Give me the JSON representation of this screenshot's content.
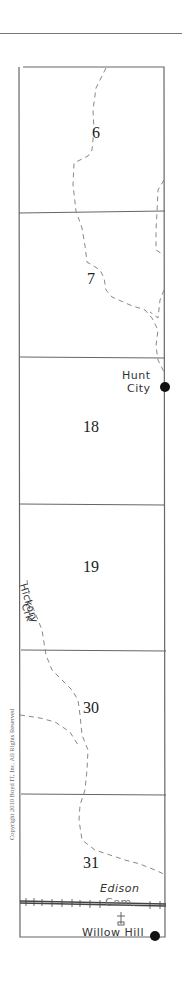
{
  "map": {
    "type": "township section strip map",
    "sections": [
      {
        "number": "6"
      },
      {
        "number": "7"
      },
      {
        "number": "18"
      },
      {
        "number": "19"
      },
      {
        "number": "30"
      },
      {
        "number": "31"
      }
    ],
    "towns": [
      {
        "name_line1": "Hunt",
        "name_line2": "City"
      },
      {
        "name": "Willow Hill"
      }
    ],
    "cemetery": {
      "name_line1": "Edison",
      "name_line2": "Cem.",
      "symbol": "cross-icon"
    },
    "creek": {
      "name_line1": "Hickory",
      "name_line2": "Crk"
    },
    "copyright": "Copyright 2010 Boyd IT, Inc. All Rights Reserved",
    "colors": {
      "line": "#666666",
      "dashed_stream": "#888888",
      "dot": "#111111",
      "railroad": "#444444"
    }
  }
}
